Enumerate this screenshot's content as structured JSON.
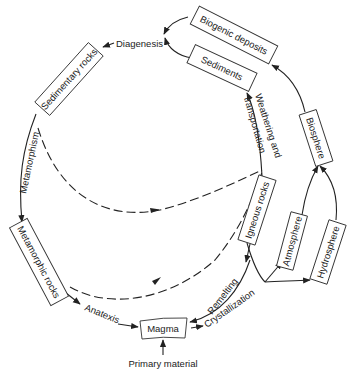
{
  "diagram": {
    "nodes": {
      "biogenic_deposits": "Biogenic deposits",
      "sediments": "Sediments",
      "sedimentary_rocks": "Sedimentary rocks",
      "metamorphic_rocks": "Metamorphic rocks",
      "magma": "Magma",
      "igneous_rocks": "Igneous rocks",
      "atmosphere": "Atmosphere",
      "hydrosphere": "Hydrosphere",
      "biosphere": "Biosphere"
    },
    "processes": {
      "diagenesis": "Diagenesis",
      "metamorphism": "Metamorphism",
      "anatexis": "Anatexis",
      "remelting": "Remelting",
      "crystallization": "Crystallization",
      "weathering_line1": "Weathering and",
      "weathering_line2": "transportation",
      "primary_material": "Primary material"
    },
    "edges": [
      {
        "from": "Biogenic deposits",
        "to": "Diagenesis",
        "style": "solid"
      },
      {
        "from": "Sediments",
        "to": "Diagenesis",
        "style": "solid"
      },
      {
        "from": "Diagenesis",
        "to": "Sedimentary rocks",
        "style": "solid"
      },
      {
        "from": "Sedimentary rocks",
        "to": "Metamorphic rocks",
        "label": "Metamorphism",
        "style": "solid"
      },
      {
        "from": "Metamorphic rocks",
        "to": "Magma",
        "label": "Anatexis",
        "style": "solid"
      },
      {
        "from": "Magma",
        "to": "Igneous rocks",
        "label": "Crystallization",
        "style": "solid"
      },
      {
        "from": "Igneous rocks",
        "to": "Magma",
        "label": "Remelting",
        "style": "solid"
      },
      {
        "from": "Igneous rocks",
        "to": "Sediments",
        "label": "Weathering and transportation",
        "style": "solid"
      },
      {
        "from": "Igneous rocks",
        "to": "Atmosphere",
        "style": "solid"
      },
      {
        "from": "Igneous rocks",
        "to": "Hydrosphere",
        "style": "solid"
      },
      {
        "from": "Atmosphere",
        "to": "Biosphere",
        "style": "solid"
      },
      {
        "from": "Hydrosphere",
        "to": "Biosphere",
        "style": "solid"
      },
      {
        "from": "Biosphere",
        "to": "Biogenic deposits",
        "style": "solid"
      },
      {
        "from": "Primary material",
        "to": "Magma",
        "style": "solid"
      },
      {
        "from": "Sedimentary rocks",
        "to": "Igneous rocks",
        "style": "dashed"
      },
      {
        "from": "Metamorphic rocks",
        "to": "Igneous rocks",
        "style": "dashed"
      }
    ]
  }
}
